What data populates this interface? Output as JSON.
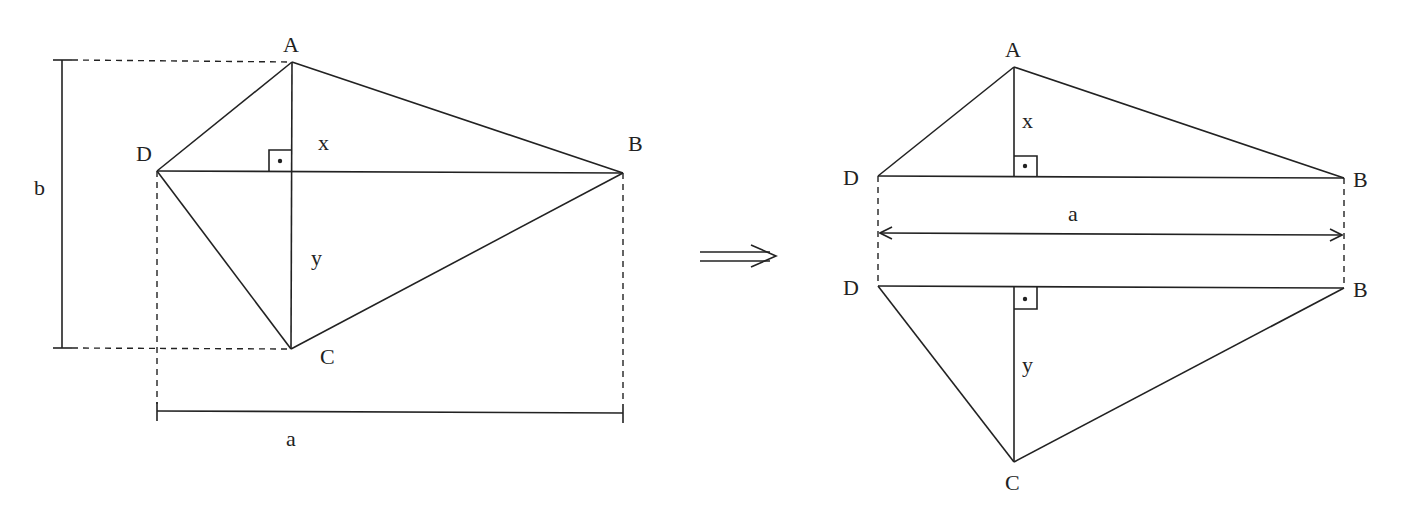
{
  "diagram": {
    "type": "geometry",
    "colors": {
      "stroke": "#222222",
      "background": "#ffffff"
    },
    "left_figure": {
      "vertices": {
        "A": {
          "label": "A",
          "x": 292,
          "y": 62
        },
        "B": {
          "label": "B",
          "x": 623,
          "y": 173
        },
        "C": {
          "label": "C",
          "x": 291,
          "y": 349
        },
        "D": {
          "label": "D",
          "x": 157,
          "y": 171
        }
      },
      "segment_labels": {
        "x": "x",
        "y": "y"
      },
      "dimensions": {
        "b": {
          "label": "b",
          "orientation": "vertical"
        },
        "a": {
          "label": "a",
          "orientation": "horizontal"
        }
      },
      "right_angle_marker": true
    },
    "implies_symbol": "⟹",
    "right_figure": {
      "top_triangle": {
        "A": {
          "label": "A"
        },
        "D": {
          "label": "D"
        },
        "B": {
          "label": "B"
        },
        "height_label": "x"
      },
      "width_label": "a",
      "bottom_triangle": {
        "D": {
          "label": "D"
        },
        "B": {
          "label": "B"
        },
        "C": {
          "label": "C"
        },
        "height_label": "y"
      },
      "right_angle_markers": 2
    }
  }
}
